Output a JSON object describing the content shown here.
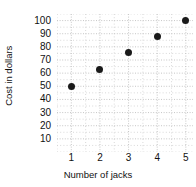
{
  "chart_data": {
    "type": "scatter",
    "title": "",
    "xlabel": "Number of jacks",
    "ylabel": "Cost in dollars",
    "x": [
      1,
      2,
      3,
      4,
      5
    ],
    "values": [
      50,
      63,
      76,
      88,
      100
    ],
    "points": [
      {
        "x": 1,
        "y": 50
      },
      {
        "x": 2,
        "y": 63
      },
      {
        "x": 3,
        "y": 76
      },
      {
        "x": 4,
        "y": 88
      },
      {
        "x": 5,
        "y": 100
      }
    ],
    "xtick_labels": [
      "1",
      "2",
      "3",
      "4",
      "5"
    ],
    "ytick_labels": [
      "10",
      "20",
      "30",
      "40",
      "50",
      "60",
      "70",
      "80",
      "90",
      "100"
    ],
    "ytick_values": [
      10,
      20,
      30,
      40,
      50,
      60,
      70,
      80,
      90,
      100
    ],
    "xlim": [
      0.5,
      5.25
    ],
    "ylim": [
      0,
      105
    ],
    "grid": true,
    "grid_style": "dotted",
    "grid_color": "#bfbfbf",
    "legend": null,
    "marker_color": "#1a1a1a",
    "background_color": "#ffffff"
  }
}
